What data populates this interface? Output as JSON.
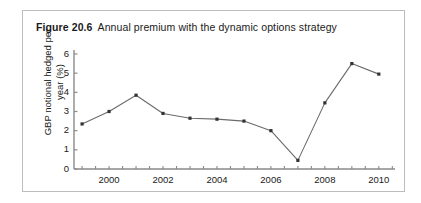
{
  "figure": {
    "label": "Figure 20.6",
    "caption": "Annual premium with the dynamic options strategy"
  },
  "chart_data": {
    "type": "line",
    "title": "Annual premium with the dynamic options strategy",
    "xlabel": "",
    "ylabel": "GBP notional hedged per year (%)",
    "x": [
      1999,
      2000,
      2001,
      2002,
      2003,
      2004,
      2005,
      2006,
      2007,
      2008,
      2009,
      2010
    ],
    "values": [
      2.35,
      3.0,
      3.85,
      2.9,
      2.65,
      2.6,
      2.5,
      2.0,
      0.45,
      3.45,
      5.5,
      4.95
    ],
    "xlim": [
      1998.7,
      2010.6
    ],
    "ylim": [
      0,
      6
    ],
    "ytick_labels": [
      "0",
      "1",
      "2",
      "3",
      "4",
      "5",
      "6"
    ],
    "ytick_values": [
      0,
      1,
      2,
      3,
      4,
      5,
      6
    ],
    "xtick_labels": [
      "2000",
      "2002",
      "2004",
      "2006",
      "2008",
      "2010"
    ],
    "xtick_values": [
      2000,
      2002,
      2004,
      2006,
      2008,
      2010
    ],
    "minor_xtick_interval": 0.5,
    "grid": false,
    "legend": null,
    "marker": "square",
    "line_color": "#6b6b6b",
    "marker_color": "#333333",
    "axis_color": "#8a8a8a"
  },
  "colors": {
    "frame_border": "#bdbdbd",
    "text": "#1a1a1a",
    "background": "#ffffff"
  }
}
